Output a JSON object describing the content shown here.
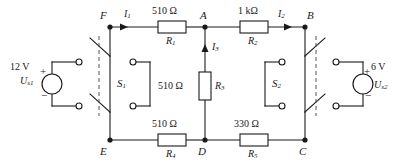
{
  "figure": {
    "type": "electrical-circuit-schematic",
    "title": ""
  },
  "nodes": [
    {
      "id": "F",
      "label": "F",
      "x": 110,
      "y": 27
    },
    {
      "id": "A",
      "label": "A",
      "x": 205,
      "y": 27
    },
    {
      "id": "B",
      "label": "B",
      "x": 305,
      "y": 27
    },
    {
      "id": "E",
      "label": "E",
      "x": 110,
      "y": 140
    },
    {
      "id": "D",
      "label": "D",
      "x": 205,
      "y": 140
    },
    {
      "id": "C",
      "label": "C",
      "x": 305,
      "y": 140
    }
  ],
  "resistors": [
    {
      "id": "R1",
      "name": "R",
      "sub": "1",
      "value": "510 Ω",
      "orientation": "horizontal",
      "between": [
        "F",
        "A"
      ]
    },
    {
      "id": "R2",
      "name": "R",
      "sub": "2",
      "value": "1 kΩ",
      "orientation": "horizontal",
      "between": [
        "A",
        "B"
      ]
    },
    {
      "id": "R3",
      "name": "R",
      "sub": "3",
      "value": "510 Ω",
      "orientation": "vertical",
      "between": [
        "A",
        "D"
      ]
    },
    {
      "id": "R4",
      "name": "R",
      "sub": "4",
      "value": "510 Ω",
      "orientation": "horizontal",
      "between": [
        "E",
        "D"
      ]
    },
    {
      "id": "R5",
      "name": "R",
      "sub": "5",
      "value": "330 Ω",
      "orientation": "horizontal",
      "between": [
        "D",
        "C"
      ]
    }
  ],
  "currents": [
    {
      "id": "I1",
      "name": "I",
      "sub": "1",
      "direction": "right",
      "branch": "F-A"
    },
    {
      "id": "I2",
      "name": "I",
      "sub": "2",
      "direction": "right",
      "branch": "A-B"
    },
    {
      "id": "I3",
      "name": "I",
      "sub": "3",
      "direction": "up",
      "branch": "D-A"
    }
  ],
  "sources": [
    {
      "id": "Us1",
      "name": "U",
      "sub": "s1",
      "value": "12 V",
      "plus": "+",
      "minus": "−",
      "polarity_top": "+",
      "polarity_bottom": "−",
      "side": "left"
    },
    {
      "id": "Us2",
      "name": "U",
      "sub": "s2",
      "value": "6 V",
      "plus": "+",
      "minus": "−",
      "polarity_top": "+",
      "polarity_bottom": "−",
      "side": "right"
    }
  ],
  "switches": [
    {
      "id": "S1",
      "name": "S",
      "sub": "1",
      "type": "double-pole",
      "state": "open",
      "label_side": "right"
    },
    {
      "id": "S2",
      "name": "S",
      "sub": "2",
      "type": "double-pole",
      "state": "open",
      "label_side": "left"
    }
  ],
  "colors": {
    "wire": "#1a1a1a",
    "text": "#1a1a1a",
    "background": "#ffffff",
    "terminal_fill": "#ffffff"
  }
}
